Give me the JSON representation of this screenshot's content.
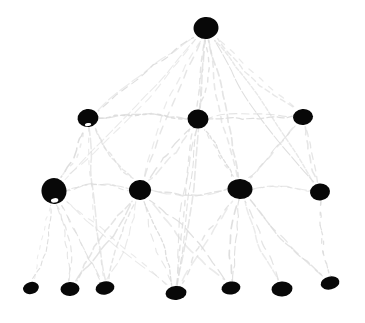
{
  "figure": {
    "style": "sketch",
    "background_color": "#ffffff",
    "node_color": "#080808",
    "edge_color": "#dcdcdc",
    "width": 365,
    "height": 323
  },
  "chart_data": {
    "type": "diagram",
    "subtype": "node-link-graph",
    "title": "",
    "xlabel": "",
    "ylabel": "",
    "grid": false,
    "legend": false,
    "layout": "layered-hierarchy",
    "level_count": 4,
    "node_count": 15,
    "edge_count": 34,
    "levels": [
      {
        "level": 0,
        "y": 28,
        "node_ids": [
          "n0"
        ]
      },
      {
        "level": 1,
        "y": 118,
        "node_ids": [
          "n1",
          "n2",
          "n3"
        ]
      },
      {
        "level": 2,
        "y": 190,
        "node_ids": [
          "n4",
          "n5",
          "n6",
          "n7"
        ]
      },
      {
        "level": 3,
        "y": 291,
        "node_ids": [
          "n8",
          "n9",
          "n10",
          "n11",
          "n12",
          "n13",
          "n14"
        ]
      }
    ],
    "nodes": [
      {
        "id": "n0",
        "label": "",
        "level": 0,
        "x": 206,
        "y": 28,
        "rx": 12.5,
        "ry": 11.0,
        "rot": -6,
        "highlight": false
      },
      {
        "id": "n1",
        "label": "",
        "level": 1,
        "x": 88,
        "y": 118,
        "rx": 10.5,
        "ry": 9.0,
        "rot": -8,
        "highlight": true
      },
      {
        "id": "n2",
        "label": "",
        "level": 1,
        "x": 198,
        "y": 119,
        "rx": 10.5,
        "ry": 9.5,
        "rot": 4,
        "highlight": false
      },
      {
        "id": "n3",
        "label": "",
        "level": 1,
        "x": 303,
        "y": 117,
        "rx": 10.0,
        "ry": 8.0,
        "rot": -5,
        "highlight": false
      },
      {
        "id": "n4",
        "label": "",
        "level": 2,
        "x": 54,
        "y": 191,
        "rx": 12.5,
        "ry": 13.0,
        "rot": -10,
        "highlight": true
      },
      {
        "id": "n5",
        "label": "",
        "level": 2,
        "x": 140,
        "y": 190,
        "rx": 11.0,
        "ry": 10.0,
        "rot": -4,
        "highlight": false
      },
      {
        "id": "n6",
        "label": "",
        "level": 2,
        "x": 240,
        "y": 189,
        "rx": 12.5,
        "ry": 10.0,
        "rot": 2,
        "highlight": false
      },
      {
        "id": "n7",
        "label": "",
        "level": 2,
        "x": 320,
        "y": 192,
        "rx": 10.0,
        "ry": 8.5,
        "rot": -6,
        "highlight": false
      },
      {
        "id": "n8",
        "label": "",
        "level": 3,
        "x": 31,
        "y": 288,
        "rx": 8.0,
        "ry": 6.0,
        "rot": -14,
        "highlight": false
      },
      {
        "id": "n9",
        "label": "",
        "level": 3,
        "x": 70,
        "y": 289,
        "rx": 9.5,
        "ry": 7.0,
        "rot": -3,
        "highlight": false
      },
      {
        "id": "n10",
        "label": "",
        "level": 3,
        "x": 105,
        "y": 288,
        "rx": 9.5,
        "ry": 6.5,
        "rot": -10,
        "highlight": false
      },
      {
        "id": "n11",
        "label": "",
        "level": 3,
        "x": 176,
        "y": 293,
        "rx": 10.5,
        "ry": 7.0,
        "rot": -5,
        "highlight": false
      },
      {
        "id": "n12",
        "label": "",
        "level": 3,
        "x": 231,
        "y": 288,
        "rx": 9.5,
        "ry": 6.5,
        "rot": -9,
        "highlight": false
      },
      {
        "id": "n13",
        "label": "",
        "level": 3,
        "x": 282,
        "y": 289,
        "rx": 10.5,
        "ry": 7.5,
        "rot": -4,
        "highlight": false
      },
      {
        "id": "n14",
        "label": "",
        "level": 3,
        "x": 330,
        "y": 283,
        "rx": 9.5,
        "ry": 6.5,
        "rot": -12,
        "highlight": false
      }
    ],
    "edges": [
      {
        "source": "n0",
        "target": "n1"
      },
      {
        "source": "n0",
        "target": "n2"
      },
      {
        "source": "n0",
        "target": "n3"
      },
      {
        "source": "n0",
        "target": "n4"
      },
      {
        "source": "n0",
        "target": "n5"
      },
      {
        "source": "n0",
        "target": "n6"
      },
      {
        "source": "n0",
        "target": "n7"
      },
      {
        "source": "n0",
        "target": "n11"
      },
      {
        "source": "n1",
        "target": "n2"
      },
      {
        "source": "n1",
        "target": "n4"
      },
      {
        "source": "n1",
        "target": "n5"
      },
      {
        "source": "n1",
        "target": "n10"
      },
      {
        "source": "n2",
        "target": "n3"
      },
      {
        "source": "n2",
        "target": "n5"
      },
      {
        "source": "n2",
        "target": "n6"
      },
      {
        "source": "n2",
        "target": "n11"
      },
      {
        "source": "n3",
        "target": "n6"
      },
      {
        "source": "n3",
        "target": "n7"
      },
      {
        "source": "n4",
        "target": "n5"
      },
      {
        "source": "n4",
        "target": "n8"
      },
      {
        "source": "n4",
        "target": "n9"
      },
      {
        "source": "n4",
        "target": "n10"
      },
      {
        "source": "n4",
        "target": "n11"
      },
      {
        "source": "n5",
        "target": "n6"
      },
      {
        "source": "n5",
        "target": "n9"
      },
      {
        "source": "n5",
        "target": "n10"
      },
      {
        "source": "n5",
        "target": "n11"
      },
      {
        "source": "n5",
        "target": "n12"
      },
      {
        "source": "n6",
        "target": "n7"
      },
      {
        "source": "n6",
        "target": "n11"
      },
      {
        "source": "n6",
        "target": "n12"
      },
      {
        "source": "n6",
        "target": "n13"
      },
      {
        "source": "n6",
        "target": "n14"
      },
      {
        "source": "n7",
        "target": "n14"
      }
    ]
  }
}
